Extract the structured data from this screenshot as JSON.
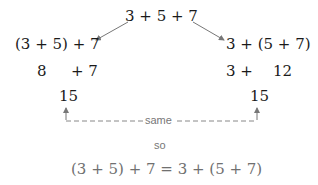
{
  "top_expression": "3 + 5 + 7",
  "left_branch": {
    "grouped": "(3 + 5) + 7",
    "step_a": "8",
    "step_b": "+ 7",
    "result": "15"
  },
  "right_branch": {
    "grouped": "3 + (5 + 7)",
    "step_a": "3 +",
    "step_b": "12",
    "result": "15"
  },
  "comparison_label": "same",
  "conclusion_word": "so",
  "conclusion_equation": "(3 + 5) + 7 = 3 + (5 + 7)",
  "colors": {
    "text": "#1a1a1a",
    "arrow": "#777777",
    "label": "#777777",
    "conclusion": "#707070"
  }
}
